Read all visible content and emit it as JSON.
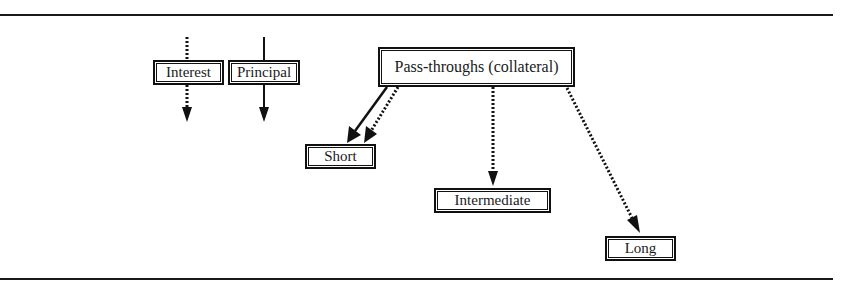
{
  "diagram": {
    "type": "flow",
    "title": "",
    "legend": [
      {
        "id": "interest",
        "label": "Interest",
        "line_style": "dotted"
      },
      {
        "id": "principal",
        "label": "Principal",
        "line_style": "solid"
      }
    ],
    "nodes": [
      {
        "id": "passthroughs",
        "label": "Pass-throughs (collateral)"
      },
      {
        "id": "short",
        "label": "Short"
      },
      {
        "id": "intermediate",
        "label": "Intermediate"
      },
      {
        "id": "long",
        "label": "Long"
      }
    ],
    "edges": [
      {
        "from": "passthroughs",
        "to": "short",
        "style": "solid",
        "meaning": "Principal"
      },
      {
        "from": "passthroughs",
        "to": "short",
        "style": "dotted",
        "meaning": "Interest"
      },
      {
        "from": "passthroughs",
        "to": "intermediate",
        "style": "dotted",
        "meaning": "Interest"
      },
      {
        "from": "passthroughs",
        "to": "long",
        "style": "dotted",
        "meaning": "Interest"
      }
    ],
    "colors": {
      "line": "#111111",
      "background": "#ffffff"
    }
  },
  "labels": {
    "interest": "Interest",
    "principal": "Principal",
    "passthroughs": "Pass-throughs (collateral)",
    "short": "Short",
    "intermediate": "Intermediate",
    "long": "Long"
  }
}
